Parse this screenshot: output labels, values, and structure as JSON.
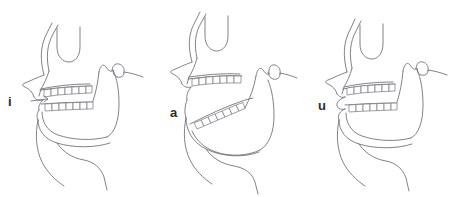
{
  "figure": {
    "background_color": "#ffffff",
    "line_color": "#6b6b73",
    "label_color": "#2b2b2b",
    "width": 455,
    "height": 197,
    "panel_count": 3
  },
  "panels": [
    {
      "id": "panel-i",
      "label": "i",
      "description": "Close front vowel: jaw nearly closed, teeth close together, tongue high and forward",
      "label_x": 8,
      "label_y": 95,
      "has_tongue_arrow": true
    },
    {
      "id": "panel-a",
      "label": "a",
      "description": "Open vowel: mandible rotated down and back, wide interdental space",
      "label_x": 170,
      "label_y": 106,
      "has_tongue_arrow": false
    },
    {
      "id": "panel-u",
      "label": "u",
      "description": "Close back rounded vowel: lips protruded, jaw slightly open",
      "label_x": 318,
      "label_y": 99,
      "has_tongue_arrow": false
    }
  ]
}
